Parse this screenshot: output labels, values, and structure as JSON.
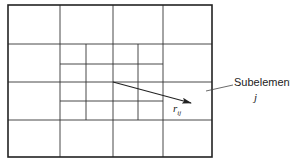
{
  "diagram": {
    "labels": {
      "subelement": "Subelement",
      "index_j": "j",
      "vector_r": "r",
      "vector_sub": "ij"
    },
    "colors": {
      "line": "#333333",
      "outer_border": "#222222",
      "background": "#ffffff"
    },
    "grid": {
      "outer": {
        "x0": 8,
        "y0": 5,
        "x1": 212,
        "y1": 157
      },
      "coarse_vertical": [
        60,
        113,
        163
      ],
      "coarse_horizontal": [
        44,
        82,
        120
      ],
      "fine_vertical": [
        86,
        138
      ],
      "fine_horizontal": [
        64,
        101
      ],
      "fine_region": {
        "x0": 60,
        "y0": 44,
        "x1": 163,
        "y1": 120
      }
    },
    "vector": {
      "x0": 113,
      "y0": 82,
      "x1": 191,
      "y1": 103
    },
    "leader_line": {
      "x0": 206,
      "y0": 91,
      "x1": 233,
      "y1": 85
    }
  }
}
